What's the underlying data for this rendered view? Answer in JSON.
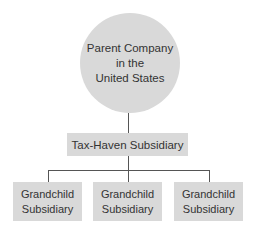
{
  "diagram": {
    "parent": {
      "lines": [
        "Parent Company",
        "in the",
        "United States"
      ]
    },
    "subsidiary": {
      "label": "Tax-Haven Subsidiary"
    },
    "grandchildren": [
      {
        "line1": "Grandchild",
        "line2": "Subsidiary"
      },
      {
        "line1": "Grandchild",
        "line2": "Subsidiary"
      },
      {
        "line1": "Grandchild",
        "line2": "Subsidiary"
      }
    ],
    "colors": {
      "node_fill": "#d9d9d9",
      "connector": "#555555",
      "text": "#333333"
    }
  }
}
